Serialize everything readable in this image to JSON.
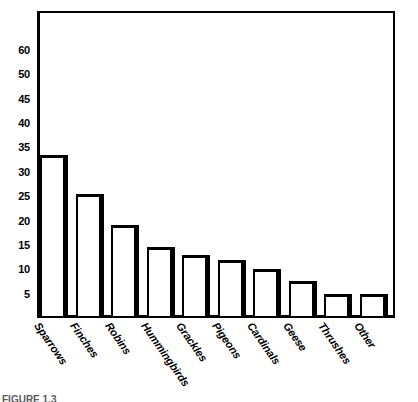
{
  "chart_data": {
    "type": "bar",
    "title": "",
    "subtitle": "",
    "xlabel": "",
    "ylabel": "",
    "categories": [
      "Sparrows",
      "Finches",
      "Robins",
      "Hummingbirds",
      "Grackles",
      "Pigeons",
      "Cardinals",
      "Geese",
      "Thrushes",
      "Other"
    ],
    "values": [
      33.5,
      25.5,
      19,
      14.5,
      13,
      12,
      10,
      7.5,
      5,
      5
    ],
    "series": [
      {
        "name": "Count",
        "values": [
          33.5,
          25.5,
          19,
          14.5,
          13,
          12,
          10,
          7.5,
          5,
          5
        ]
      }
    ],
    "ylim": [
      0,
      63
    ],
    "ytick_labels": [
      "5",
      "10",
      "15",
      "20",
      "25",
      "30",
      "35",
      "40",
      "45",
      "50",
      "60"
    ],
    "ytick_values": [
      5,
      10,
      15,
      20,
      25,
      30,
      35,
      40,
      45,
      50,
      55
    ],
    "grid": false,
    "legend": false,
    "legend_position": "none",
    "bar_fill_color": "#ffffff",
    "bar_edge_color": "#000000",
    "background_color": "#ffffff",
    "annotations": []
  },
  "figure": {
    "caption_sliver": "FIGURE 1.3"
  }
}
